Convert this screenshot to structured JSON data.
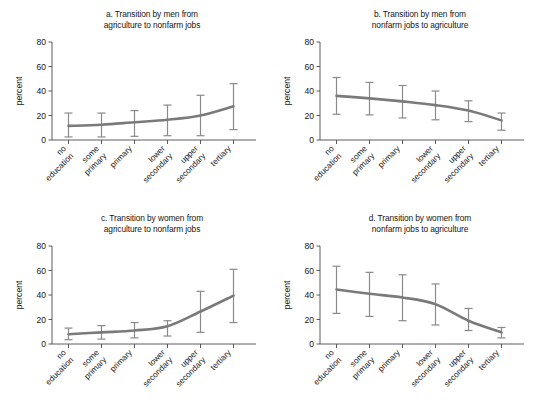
{
  "figure": {
    "background_color": "#ffffff",
    "line_color": "#7a7a7a",
    "error_bar_color": "#8a8a8a",
    "axis_color": "#4a4a4a",
    "text_color": "#161616",
    "panel_count": 4
  },
  "axis": {
    "ylabel": "percent",
    "yticks": [
      "0",
      "20",
      "40",
      "60",
      "80"
    ],
    "ytick_values": [
      0,
      20,
      40,
      60,
      80
    ],
    "ylim": [
      0,
      80
    ],
    "xticks": [
      "no\neducation",
      "some\nprimary",
      "primary",
      "lower\nsecondary",
      "upper\nsecondary",
      "tertiary"
    ],
    "xtick_labels_flat": [
      "no education",
      "some primary",
      "primary",
      "lower secondary",
      "upper secondary",
      "tertiary"
    ],
    "grid": false,
    "legend": false
  },
  "chart_data": [
    {
      "type": "line",
      "panel": "a",
      "title": "a. Transition by men from\nagriculture to nonfarm jobs",
      "title_line1": "a. Transition by men from",
      "title_line2": "agriculture to nonfarm jobs",
      "xlabel": "",
      "ylabel": "percent",
      "ylim": [
        0,
        80
      ],
      "categories": [
        "no education",
        "some primary",
        "primary",
        "lower secondary",
        "upper secondary",
        "tertiary"
      ],
      "values": [
        11.5,
        12.5,
        14.5,
        16.5,
        20.0,
        27.5
      ],
      "ci_lower": [
        2.5,
        2.5,
        3.0,
        3.5,
        3.5,
        8.5
      ],
      "ci_upper": [
        22.0,
        22.0,
        24.0,
        28.5,
        36.5,
        46.0
      ],
      "grid": false,
      "legend": false
    },
    {
      "type": "line",
      "panel": "b",
      "title": "b. Transition by men from\nnonfarm jobs to agriculture",
      "title_line1": "b. Transition by men from",
      "title_line2": "nonfarm jobs to agriculture",
      "xlabel": "",
      "ylabel": "percent",
      "ylim": [
        0,
        80
      ],
      "categories": [
        "no education",
        "some primary",
        "primary",
        "lower secondary",
        "upper secondary",
        "tertiary"
      ],
      "values": [
        36.0,
        34.0,
        31.5,
        28.5,
        24.0,
        16.0
      ],
      "ci_lower": [
        21.0,
        20.5,
        18.0,
        16.5,
        15.0,
        8.0
      ],
      "ci_upper": [
        51.0,
        47.0,
        44.5,
        40.0,
        32.0,
        22.0
      ],
      "grid": false,
      "legend": false
    },
    {
      "type": "line",
      "panel": "c",
      "title": "c. Transition by women from\nagriculture to nonfarm jobs",
      "title_line1": "c. Transition by women from",
      "title_line2": "agriculture to nonfarm jobs",
      "xlabel": "",
      "ylabel": "percent",
      "ylim": [
        0,
        80
      ],
      "categories": [
        "no education",
        "some primary",
        "primary",
        "lower secondary",
        "upper secondary",
        "tertiary"
      ],
      "values": [
        8.0,
        9.5,
        11.0,
        14.5,
        26.5,
        39.5
      ],
      "ci_lower": [
        3.5,
        4.0,
        5.0,
        6.5,
        9.5,
        17.5
      ],
      "ci_upper": [
        13.0,
        15.0,
        17.5,
        19.0,
        43.0,
        61.0
      ],
      "grid": false,
      "legend": false
    },
    {
      "type": "line",
      "panel": "d",
      "title": "d. Transition by women from\nnonfarm jobs to agriculture",
      "title_line1": "d. Transition by women from",
      "title_line2": "nonfarm jobs to agriculture",
      "xlabel": "",
      "ylabel": "percent",
      "ylim": [
        0,
        80
      ],
      "categories": [
        "no education",
        "some primary",
        "primary",
        "lower secondary",
        "upper secondary",
        "tertiary"
      ],
      "values": [
        44.5,
        41.0,
        38.0,
        32.5,
        19.0,
        9.5
      ],
      "ci_lower": [
        25.0,
        22.5,
        19.0,
        15.5,
        11.0,
        5.0
      ],
      "ci_upper": [
        63.5,
        58.5,
        56.5,
        49.0,
        29.0,
        13.5
      ],
      "grid": false,
      "legend": false
    }
  ]
}
